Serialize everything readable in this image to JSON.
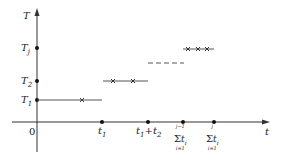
{
  "diagram": {
    "y_axis_label": "T",
    "x_axis_label": "t",
    "origin_label": "0",
    "y_ticks": [
      {
        "label": "T",
        "sub": "j",
        "y": 48
      },
      {
        "label": "T",
        "sub": "2",
        "y": 81
      },
      {
        "label": "T",
        "sub": "1",
        "y": 100
      }
    ],
    "x_ticks": [
      {
        "label": "t",
        "sub": "1",
        "x": 102
      },
      {
        "label": "t1+t2",
        "x": 148
      },
      {
        "label": "sum_{i=1}^{j-1} t_i",
        "x": 183
      },
      {
        "label": "sum_{i=1}^{j} t_i",
        "x": 214
      }
    ],
    "sum1": {
      "top": "j−1",
      "sig": "Σ",
      "var": "t",
      "sub": "i",
      "bot": "i=1"
    },
    "sum2": {
      "top": "j",
      "sig": "Σ",
      "var": "t",
      "sub": "i",
      "bot": "i=1"
    },
    "t1t2": {
      "a": "t",
      "a_sub": "1",
      "plus": "+",
      "b": "t",
      "b_sub": "2"
    },
    "segments": [
      {
        "level": "T1",
        "x_start": 37,
        "x_end": 102,
        "y": 100,
        "crosses": [
          82
        ]
      },
      {
        "level": "T2",
        "x_start": 103,
        "x_end": 148,
        "y": 81,
        "crosses": [
          113,
          133
        ]
      },
      {
        "level": "dashed",
        "x_start": 148,
        "x_end": 183,
        "y": 63,
        "crosses": []
      },
      {
        "level": "Tj",
        "x_start": 183,
        "x_end": 214,
        "y": 49,
        "crosses": [
          188,
          198,
          207
        ]
      }
    ]
  }
}
